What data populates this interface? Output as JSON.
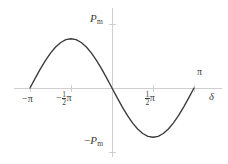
{
  "figure": {
    "title": "",
    "background": "#ffffff",
    "curve_color": "#3a3a3a",
    "axis_color": "#cfcfcf",
    "text_color": "#3b3b3b"
  },
  "labels": {
    "y_top": {
      "minus": "",
      "symbol": "P",
      "sub": "m",
      "text": "Pm"
    },
    "y_bottom": {
      "minus": "−",
      "symbol": "P",
      "sub": "m",
      "text": "-Pm"
    },
    "x_minus_pi": "−π",
    "x_minus_half_pi": {
      "minus": "−",
      "num": "1",
      "den": "2",
      "pi": "π"
    },
    "x_half_pi": {
      "minus": "",
      "num": "1",
      "den": "2",
      "pi": "π"
    },
    "x_pi": "π",
    "x_axis_name": "δ"
  },
  "chart_data": {
    "type": "line",
    "title": "",
    "xlabel": "δ",
    "ylabel": "",
    "xlim": [
      -3.14159,
      3.14159
    ],
    "ylim": [
      -1.25,
      1.25
    ],
    "grid": false,
    "legend": null,
    "x_ticks": [
      -3.14159,
      -1.5708,
      1.5708,
      3.14159
    ],
    "x_ticklabels": [
      "−π",
      "−½π",
      "½π",
      "π"
    ],
    "y_ticks": [
      -1,
      1
    ],
    "y_ticklabels": [
      "−Pm",
      "Pm"
    ],
    "series": [
      {
        "name": "P = Pm sin δ",
        "x": [
          -3.14159,
          -2.94524,
          -2.74889,
          -2.55254,
          -2.35619,
          -2.15984,
          -1.9635,
          -1.76715,
          -1.5708,
          -1.37445,
          -1.1781,
          -0.98175,
          -0.7854,
          -0.58905,
          -0.3927,
          -0.19635,
          0.0,
          0.19635,
          0.3927,
          0.58905,
          0.7854,
          0.98175,
          1.1781,
          1.37445,
          1.5708,
          1.76715,
          1.9635,
          2.15984,
          2.35619,
          2.55254,
          2.74889,
          2.94524,
          3.14159
        ],
        "y": [
          0.0,
          0.19509,
          0.38268,
          0.55557,
          0.70711,
          0.83147,
          0.92388,
          0.98079,
          1.0,
          0.98079,
          0.92388,
          0.83147,
          0.70711,
          0.55557,
          0.38268,
          0.19509,
          0.0,
          -0.19509,
          -0.38268,
          -0.55557,
          -0.70711,
          -0.83147,
          -0.92388,
          -0.98079,
          -1.0,
          -0.98079,
          -0.92388,
          -0.83147,
          -0.70711,
          -0.55557,
          -0.38268,
          -0.19509,
          0.0
        ]
      }
    ],
    "note": "Sine half-wave rising to +Pm at -½π and falling to -Pm at +½π (power-angle characteristic)"
  }
}
